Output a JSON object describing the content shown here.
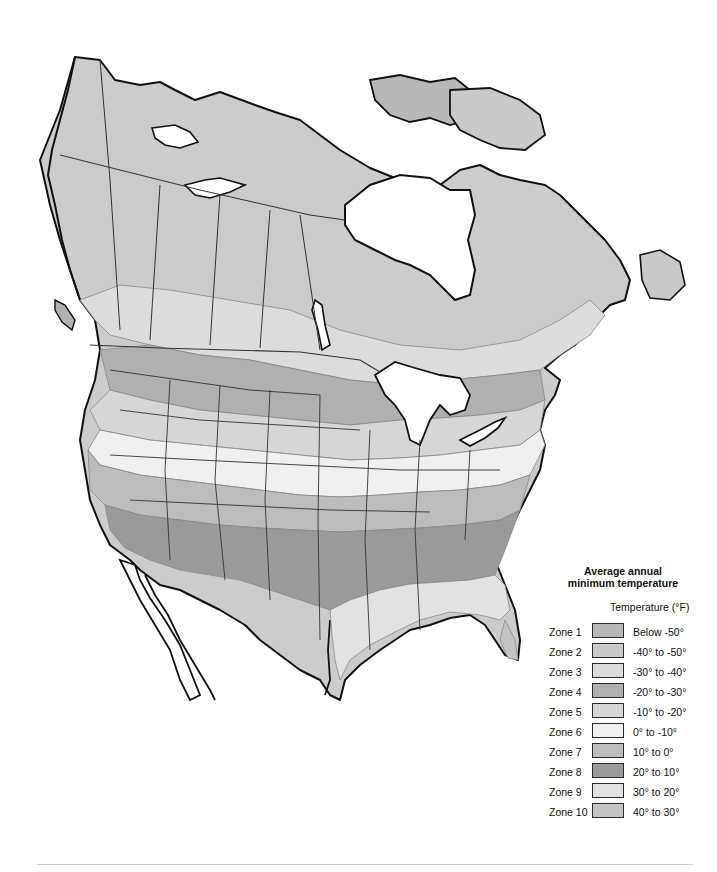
{
  "map": {
    "type": "choropleth",
    "region": "North America (Canada, United States, northern Mexico)",
    "subject": "Plant hardiness zones - average annual minimum temperature",
    "colors": {
      "ocean": "#ffffff",
      "outline": "#111111",
      "border": "#333333"
    }
  },
  "legend": {
    "title_line1": "Average annual",
    "title_line2": "minimum temperature",
    "unit_label": "Temperature (°F)",
    "zones": [
      {
        "zone": "Zone 1",
        "range": "Below -50°",
        "color": "#b8b8b8"
      },
      {
        "zone": "Zone 2",
        "range": "-40° to -50°",
        "color": "#c9c9c9"
      },
      {
        "zone": "Zone 3",
        "range": "-30° to -40°",
        "color": "#dcdcdc"
      },
      {
        "zone": "Zone 4",
        "range": "-20° to -30°",
        "color": "#b0b0b0"
      },
      {
        "zone": "Zone 5",
        "range": "-10° to -20°",
        "color": "#d6d6d6"
      },
      {
        "zone": "Zone 6",
        "range": "0° to -10°",
        "color": "#f0f0f0"
      },
      {
        "zone": "Zone 7",
        "range": "10° to 0°",
        "color": "#bdbdbd"
      },
      {
        "zone": "Zone 8",
        "range": "20° to 10°",
        "color": "#9a9a9a"
      },
      {
        "zone": "Zone 9",
        "range": "30° to 20°",
        "color": "#e2e2e2"
      },
      {
        "zone": "Zone 10",
        "range": "40° to 30°",
        "color": "#c4c4c4"
      }
    ]
  }
}
